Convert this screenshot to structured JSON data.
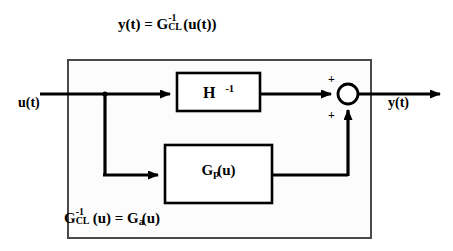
{
  "diagram": {
    "title_equation": {
      "lhs": "y(t) = ",
      "g": "G",
      "superscript": "-1",
      "subscript": "CL",
      "rhs": "(u(t))",
      "full_text": "y(t) = G^-1_CL(u(t))"
    },
    "bottom_equation": {
      "g1": "G",
      "g1_superscript": "-1",
      "g1_subscript": "CL",
      "mid": "(u) = ",
      "g2": "G",
      "g2_subscript": "a",
      "tail": "(u)",
      "full_text": "G^-1_CL(u) = G_a(u)"
    },
    "input_label": "u(t)",
    "output_label": "y(t)",
    "blocks": [
      {
        "name": "inverse-model-block",
        "main": "H",
        "superscript": "-1",
        "full_text": "H^-1"
      },
      {
        "name": "plant-block",
        "main": "G",
        "subscript": "p",
        "arg": "(u)",
        "full_text": "G_p(u)"
      }
    ],
    "summing_junction": {
      "name": "summing-junction",
      "sign_top": "+",
      "sign_bottom": "+"
    },
    "colors": {
      "line": "#000000",
      "text": "#000000",
      "outer_box_border": "#4a4a4a",
      "outer_box_fill": "#fcfcfd",
      "background": "#ffffff"
    }
  }
}
